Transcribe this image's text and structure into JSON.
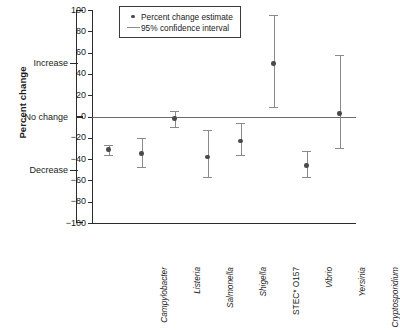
{
  "chart_data": {
    "type": "scatter",
    "title": "",
    "xlabel": "",
    "ylabel": "Percent change",
    "ylim": [
      -100,
      100
    ],
    "grid": false,
    "legend_position": "top-center",
    "yticks": [
      100,
      80,
      60,
      40,
      20,
      0,
      -20,
      -40,
      -60,
      -80,
      -100
    ],
    "ytick_labels": [
      "100",
      "80",
      "60",
      "40",
      "20",
      "0",
      "−20",
      "−40",
      "−60",
      "−80",
      "−100"
    ],
    "qualitative_labels": [
      {
        "text": "Increase",
        "value": 50
      },
      {
        "text": "No change",
        "value": 0
      },
      {
        "text": "Decrease",
        "value": -50
      }
    ],
    "legend": [
      {
        "label": "Percent change estimate",
        "marker": "dot"
      },
      {
        "label": "95% confidence interval",
        "marker": "line"
      }
    ],
    "categories": [
      "Campylobacter",
      "Listeria",
      "Salmonella",
      "Shigella",
      "STEC* O157",
      "Vibrio",
      "Yersinia",
      "Cryptosporidium"
    ],
    "category_styles": [
      "italic",
      "italic",
      "italic",
      "italic",
      "normal",
      "italic",
      "italic",
      "italic"
    ],
    "series": [
      {
        "name": "Percent change estimate",
        "values": [
          -31,
          -35,
          -2,
          -38,
          -23,
          50,
          -46,
          3
        ],
        "ci_low": [
          -36,
          -47,
          -10,
          -57,
          -36,
          9,
          -57,
          -30
        ],
        "ci_high": [
          -27,
          -20,
          5,
          -13,
          -6,
          95,
          -32,
          58
        ]
      }
    ],
    "reference_line": 0,
    "footnote_marker": "*"
  },
  "colors": {
    "axis": "#2b2b2b",
    "ci": "#8a8a8a",
    "point": "#4a4a4a",
    "zero_line": "#6b6b6b",
    "background": "#ffffff"
  }
}
